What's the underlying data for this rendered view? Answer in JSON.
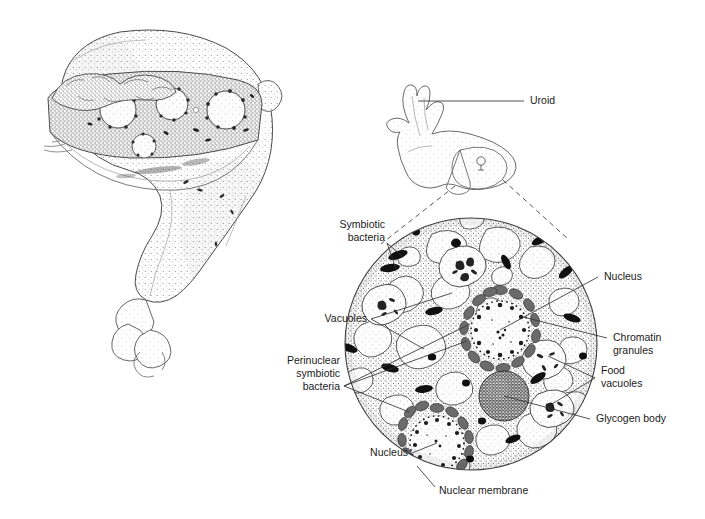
{
  "figure": {
    "background_color": "#ffffff",
    "ink_color": "#1a1a1a"
  },
  "panels": {
    "left": {
      "name": "whole-organism-cutaway",
      "description": "Stipple-shaded drawing of a multinucleate amoeba with a cutaway band exposing internal nuclei and symbiotic bacteria"
    },
    "right": {
      "name": "cell-cross-section",
      "description": "Magnified circular cross-section of the amoeba cytoplasm"
    }
  },
  "labels": {
    "uroid": {
      "text": "Uroid",
      "align": "left",
      "x": 530,
      "y": 104
    },
    "symbiotic": {
      "lines": [
        "Symbiotic",
        "bacteria"
      ],
      "align": "right",
      "x": 385,
      "y": 228
    },
    "vacuoles": {
      "text": "Vacuoles",
      "align": "right",
      "x": 367,
      "y": 322
    },
    "perinuclear": {
      "lines": [
        "Perinuclear",
        "symbiotic",
        "bacteria"
      ],
      "align": "right",
      "x": 340,
      "y": 364
    },
    "nucleus_top": {
      "text": "Nucleus",
      "align": "left",
      "x": 604,
      "y": 280
    },
    "chromatin": {
      "lines": [
        "Chromatin",
        "granules"
      ],
      "align": "left",
      "x": 613,
      "y": 341
    },
    "food": {
      "lines": [
        "Food",
        "vacuoles"
      ],
      "align": "left",
      "x": 601,
      "y": 374
    },
    "glycogen": {
      "text": "Glycogen body",
      "align": "left",
      "x": 596,
      "y": 422
    },
    "nucleus_bot": {
      "text": "Nucleus",
      "align": "right",
      "x": 408,
      "y": 456
    },
    "nuclear_memb": {
      "text": "Nuclear membrane",
      "align": "left",
      "x": 439,
      "y": 494
    }
  },
  "structures": {
    "cell": {
      "center_x": 471,
      "center_y": 344,
      "radius": 126
    },
    "nuclei": [
      {
        "name": "upper-nucleus",
        "cx": 500,
        "cy": 330,
        "r": 33
      },
      {
        "name": "lower-nucleus",
        "cx": 437,
        "cy": 443,
        "r": 30
      }
    ],
    "glycogen_body": {
      "cx": 504,
      "cy": 396,
      "r": 25
    },
    "vacuole_count": 22,
    "symbiotic_bacteria_count": 18,
    "food_vacuole_count": 5
  }
}
